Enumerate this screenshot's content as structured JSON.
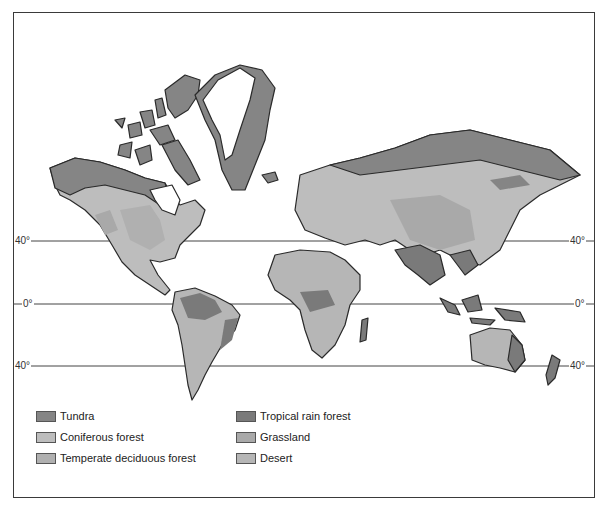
{
  "map": {
    "title": "World biomes map",
    "latitude_lines": [
      {
        "label": "40°",
        "y": 241
      },
      {
        "label": "0°",
        "y": 304
      },
      {
        "label": "40°",
        "y": 366
      }
    ]
  },
  "legend": {
    "items": [
      {
        "id": "tundra",
        "label": "Tundra",
        "color": "#858585"
      },
      {
        "id": "coniferous",
        "label": "Coniferous forest",
        "color": "#bdbdbd"
      },
      {
        "id": "temperate",
        "label": "Temperate deciduous forest",
        "color": "#b0b0b0"
      },
      {
        "id": "tropical",
        "label": "Tropical rain forest",
        "color": "#7a7a7a"
      },
      {
        "id": "grassland",
        "label": "Grassland",
        "color": "#a9a9a9"
      },
      {
        "id": "desert",
        "label": "Desert",
        "color": "#b6b6b6"
      }
    ]
  },
  "colors": {
    "ice": "#ffffff",
    "outline": "#2a2a2a",
    "grid": "#444444"
  }
}
